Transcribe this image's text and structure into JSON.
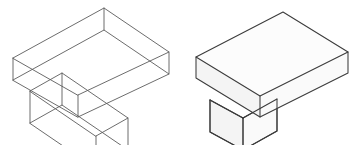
{
  "document": {
    "title": "Isometric Slab With Pedestal — Wireframe and Solid Views",
    "background_color": "#ffffff",
    "line_color": "#5b5b5b",
    "solid_line_color": "#3b3b3b",
    "width_px": 361,
    "height_px": 145
  },
  "figures": [
    {
      "id": "wireframe-view",
      "label": "Wireframe isometric view",
      "description": "Transparent rectangular slab with rectangular pedestal below; all hidden edges shown",
      "style": "wireframe",
      "hidden_lines": "visible",
      "geometry": {
        "slab": {
          "top_apex": [
            104,
            8
          ],
          "left_corner": [
            13,
            58
          ],
          "right_corner": [
            169,
            52
          ],
          "front_apex": [
            78,
            95
          ],
          "slab_thickness_px": 22
        },
        "pedestal": {
          "top_back": [
            62,
            84
          ],
          "left_corner": [
            30,
            102
          ],
          "right_corner": [
            128,
            97
          ],
          "front_apex": [
            96,
            115
          ],
          "height_px": 32
        }
      }
    },
    {
      "id": "solid-view",
      "label": "Solid isometric view",
      "description": "Same rectangular slab with pedestal, hidden lines removed, shaded faces",
      "style": "solid",
      "hidden_lines": "removed",
      "geometry": {
        "slab": {
          "top_apex": [
            283,
            12
          ],
          "left_corner": [
            196,
            57
          ],
          "right_corner": [
            348,
            52
          ],
          "front_apex": [
            260,
            96
          ],
          "slab_thickness_px": 21
        },
        "pedestal": {
          "left_corner": [
            210,
            100
          ],
          "right_corner": [
            277,
            118
          ],
          "front_apex": [
            243,
            135
          ],
          "height_px": 33
        }
      }
    }
  ],
  "captions": {
    "left": "",
    "right": ""
  }
}
